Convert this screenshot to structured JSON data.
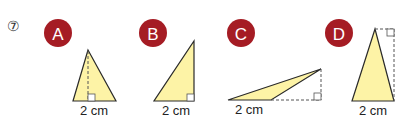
{
  "problem_number": "⑦",
  "colors": {
    "badge": "#a51c24",
    "badge_text": "#ffffff",
    "fill": "#fdf3a6",
    "stroke": "#2a2a2a",
    "dash": "#555555"
  },
  "triangles": [
    {
      "label": "A",
      "base_label": "2 cm"
    },
    {
      "label": "B",
      "base_label": "2 cm"
    },
    {
      "label": "C",
      "base_label": "2 cm"
    },
    {
      "label": "D",
      "base_label": "2 cm"
    }
  ]
}
